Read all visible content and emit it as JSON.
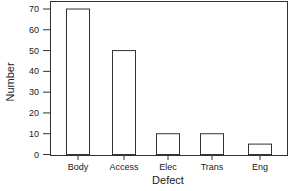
{
  "chart_data": {
    "type": "bar",
    "title": "",
    "xlabel": "Defect",
    "ylabel": "Number",
    "categories": [
      "Body",
      "Access",
      "Elec",
      "Trans",
      "Eng"
    ],
    "values": [
      70,
      50,
      10,
      10,
      5
    ],
    "ylim": [
      0,
      70
    ],
    "yticks": [
      0,
      10,
      20,
      30,
      40,
      50,
      60,
      70
    ],
    "grid": false,
    "legend": null,
    "bar_fill": "#ffffff",
    "bar_stroke": "#333333"
  }
}
